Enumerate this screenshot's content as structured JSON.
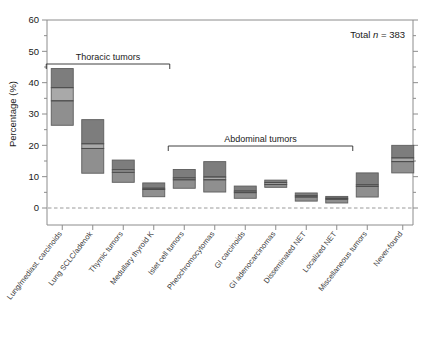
{
  "chart_data": {
    "type": "bar",
    "title": "",
    "xlabel": "",
    "ylabel": "Percentage (%)",
    "ylim": [
      0,
      60
    ],
    "ytick_labels": [
      "0",
      "10",
      "20",
      "30",
      "40",
      "50",
      "60"
    ],
    "ytick_values": [
      0,
      10,
      20,
      30,
      40,
      50,
      60
    ],
    "yminor_step": 5,
    "grid": false,
    "legend": "none",
    "zero_reference_line": 0,
    "annotation": {
      "text_prefix": "Total ",
      "text_italic": "n",
      "text_suffix": " = 383",
      "total_n": 383
    },
    "groups": [
      {
        "label": "Thoracic tumors",
        "from_index": 0,
        "to_index": 3
      },
      {
        "label": "Abdominal tumors",
        "from_index": 4,
        "to_index": 9
      }
    ],
    "categories": [
      "Lung/mediast. carcinoids",
      "Lung SCLC/adenok",
      "Thymic tumors",
      "Medullary thyroid K",
      "Islet cell tumors",
      "Pheochromocytomas",
      "GI carcinoids",
      "GI adenocarcinomas",
      "Disseminated NET",
      "Localized NET",
      "Miscellaneous tumors",
      "Never-found"
    ],
    "series": [
      {
        "name": "upper",
        "values": [
          44.5,
          28.2,
          15.3,
          8.0,
          12.3,
          14.8,
          7.0,
          8.9,
          4.8,
          3.7,
          11.2,
          20.0
        ]
      },
      {
        "name": "median_high",
        "values": [
          38.4,
          20.5,
          12.2,
          6.3,
          9.6,
          9.9,
          5.4,
          8.1,
          3.9,
          3.1,
          7.4,
          16.0
        ]
      },
      {
        "name": "median_low",
        "values": [
          34.2,
          19.0,
          11.4,
          5.9,
          9.0,
          9.0,
          4.9,
          7.5,
          3.5,
          2.8,
          6.9,
          14.8
        ]
      },
      {
        "name": "lower",
        "values": [
          26.4,
          11.1,
          8.2,
          3.6,
          6.3,
          5.1,
          3.1,
          6.6,
          2.2,
          1.6,
          3.5,
          11.2
        ]
      }
    ],
    "colors": {
      "band_upper": "#7d7d7d",
      "band_middle": "#a9a9a9",
      "band_lower": "#8f8f8f",
      "box_edge": "#5d5d5d",
      "axis": "#8c8c8c",
      "text": "#1a1a1a",
      "zero_line": "#9a9a9a",
      "background": "#ffffff"
    }
  }
}
